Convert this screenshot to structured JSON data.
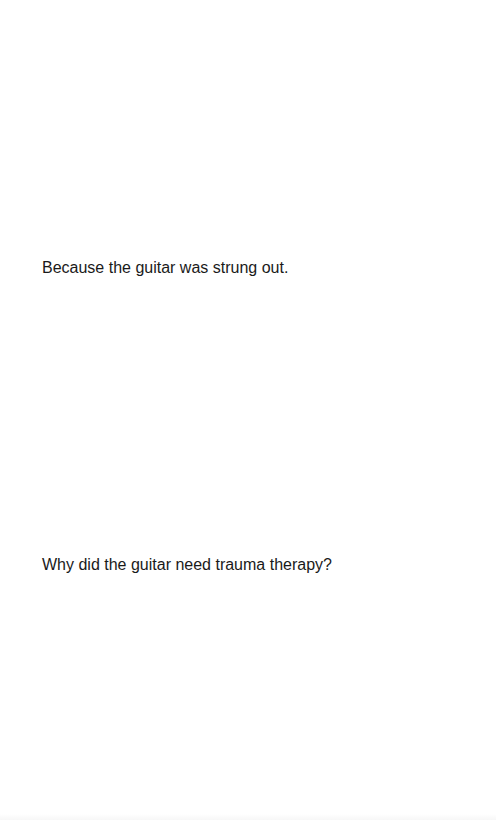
{
  "card": {
    "answer": "Because the guitar was strung out.",
    "question": "Why did the guitar need trauma therapy?"
  },
  "colors": {
    "background": "#ffffff",
    "text": "#1a1a1a"
  }
}
